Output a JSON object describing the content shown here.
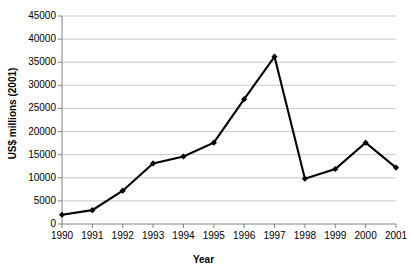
{
  "chart_data": {
    "type": "line",
    "title": "",
    "xlabel": "Year",
    "ylabel": "US$ millions (2001)",
    "categories": [
      "1990",
      "1991",
      "1992",
      "1993",
      "1994",
      "1995",
      "1996",
      "1997",
      "1998",
      "1999",
      "2000",
      "2001"
    ],
    "values": [
      2000,
      3000,
      7200,
      13100,
      14600,
      17600,
      27000,
      36200,
      9800,
      11900,
      17600,
      12200
    ],
    "series": [
      {
        "name": "US$ millions (2001)",
        "values": [
          2000,
          3000,
          7200,
          13100,
          14600,
          17600,
          27000,
          36200,
          9800,
          11900,
          17600,
          12200
        ]
      }
    ],
    "ylim": [
      0,
      45000
    ],
    "ytick_labels": [
      "0",
      "5000",
      "10000",
      "15000",
      "20000",
      "25000",
      "30000",
      "35000",
      "40000",
      "45000"
    ],
    "ytick_values": [
      0,
      5000,
      10000,
      15000,
      20000,
      25000,
      30000,
      35000,
      40000,
      45000
    ],
    "grid": true,
    "grid_axis": "y",
    "legend": false,
    "legend_position": "none",
    "marker": "filled-diamond",
    "colors": {
      "line": "#000000",
      "marker": "#000000",
      "gridline": "#c8c8c8",
      "axis": "#808080",
      "background": "#ffffff",
      "text": "#000000"
    }
  }
}
